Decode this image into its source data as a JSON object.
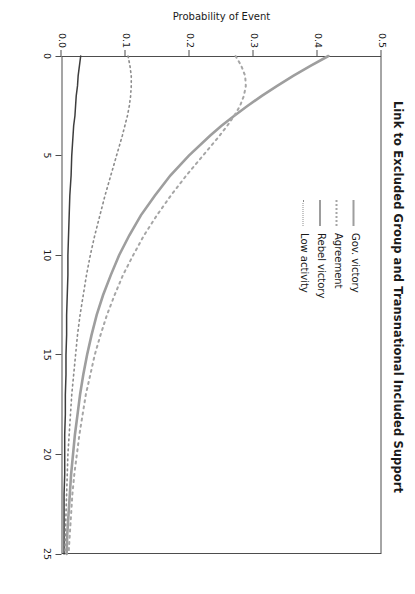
{
  "chart_data": {
    "type": "line",
    "title": "Link to Excluded Group and Transnational Included Support",
    "xlabel": "",
    "ylabel": "Probability of Event",
    "xlim": [
      0,
      25
    ],
    "ylim": [
      0.0,
      0.5
    ],
    "xticks": [
      "0",
      "5",
      "10",
      "15",
      "20",
      "25"
    ],
    "xtick_values": [
      0,
      5,
      10,
      15,
      20,
      25
    ],
    "yticks": [
      "0.0",
      "0.1",
      "0.2",
      "0.3",
      "0.4",
      "0.5"
    ],
    "ytick_values": [
      0.0,
      0.1,
      0.2,
      0.3,
      0.4,
      0.5
    ],
    "grid": false,
    "legend_position": "upper-center",
    "x": [
      0,
      0.5,
      1,
      1.5,
      2,
      2.5,
      3,
      3.5,
      4,
      5,
      6,
      7,
      8,
      9,
      10,
      11,
      12,
      13,
      14,
      15,
      16,
      17,
      18,
      19,
      20,
      21,
      22,
      23,
      24,
      25
    ],
    "series": [
      {
        "name": "Gov. victory",
        "style": "solid",
        "width": 2.6,
        "color": "#9e9e9e",
        "values": [
          0.417,
          0.389,
          0.362,
          0.337,
          0.313,
          0.291,
          0.27,
          0.25,
          0.232,
          0.199,
          0.17,
          0.146,
          0.124,
          0.106,
          0.09,
          0.077,
          0.065,
          0.055,
          0.047,
          0.04,
          0.034,
          0.029,
          0.025,
          0.021,
          0.018,
          0.015,
          0.013,
          0.011,
          0.009,
          0.008
        ]
      },
      {
        "name": "Agreement",
        "style": "dotted",
        "width": 2.0,
        "color": "#a6a6a6",
        "values": [
          0.272,
          0.281,
          0.287,
          0.288,
          0.285,
          0.279,
          0.27,
          0.259,
          0.247,
          0.221,
          0.195,
          0.171,
          0.149,
          0.129,
          0.112,
          0.096,
          0.083,
          0.071,
          0.061,
          0.052,
          0.045,
          0.038,
          0.033,
          0.028,
          0.024,
          0.02,
          0.017,
          0.015,
          0.013,
          0.011
        ]
      },
      {
        "name": "Rebel victory",
        "style": "solid",
        "width": 1.5,
        "color": "#3d3d3d",
        "values": [
          0.03,
          0.028,
          0.026,
          0.025,
          0.023,
          0.022,
          0.021,
          0.019,
          0.018,
          0.016,
          0.015,
          0.013,
          0.012,
          0.011,
          0.01,
          0.01,
          0.009,
          0.008,
          0.008,
          0.007,
          0.007,
          0.006,
          0.006,
          0.005,
          0.005,
          0.005,
          0.004,
          0.004,
          0.004,
          0.004
        ]
      },
      {
        "name": "Low activity",
        "style": "dotted",
        "width": 1.6,
        "color": "#8c8c8c",
        "values": [
          0.104,
          0.107,
          0.109,
          0.109,
          0.108,
          0.106,
          0.103,
          0.099,
          0.095,
          0.086,
          0.077,
          0.068,
          0.06,
          0.052,
          0.045,
          0.039,
          0.034,
          0.029,
          0.025,
          0.022,
          0.019,
          0.016,
          0.014,
          0.012,
          0.01,
          0.009,
          0.008,
          0.007,
          0.006,
          0.005
        ]
      }
    ]
  },
  "legend": {
    "items": [
      {
        "label": "Gov. victory",
        "key": "solid-gray"
      },
      {
        "label": "Agreement",
        "key": "dotted-gray"
      },
      {
        "label": "Rebel victory",
        "key": "solid-dark"
      },
      {
        "label": "Low activity",
        "key": "dotted-dark"
      }
    ]
  }
}
